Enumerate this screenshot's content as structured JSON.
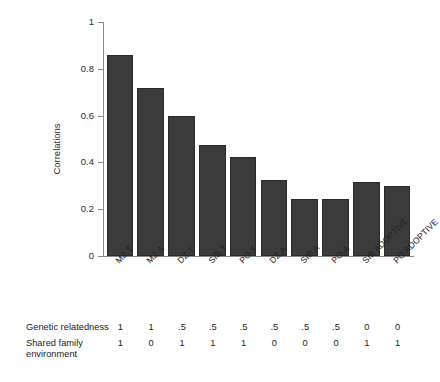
{
  "chart_data": {
    "type": "bar",
    "title": "",
    "xlabel": "",
    "ylabel": "Correlations",
    "ylim": [
      0,
      1
    ],
    "yticks": [
      "0",
      "0.2",
      "0.4",
      "0.6",
      "0.8",
      "1"
    ],
    "ytick_values": [
      0,
      0.2,
      0.4,
      0.6,
      0.8,
      1
    ],
    "grid": false,
    "legend": null,
    "bar_color": "#3b3b3b",
    "categories": [
      "MZ.T",
      "MZ.A",
      "DZ.T",
      "SIB.T",
      "PO.T",
      "DZ.A",
      "SIB.A",
      "PO.A",
      "SIB ADOPTIVE",
      "PO ADOPTIVE"
    ],
    "values": [
      0.86,
      0.72,
      0.6,
      0.475,
      0.425,
      0.325,
      0.245,
      0.245,
      0.315,
      0.3
    ],
    "annotation_rows": [
      {
        "label": "Genetic relatedness",
        "values": [
          "1",
          "1",
          ".5",
          ".5",
          ".5",
          ".5",
          ".5",
          ".5",
          "0",
          "0"
        ]
      },
      {
        "label": "Shared family environment",
        "values": [
          "1",
          "0",
          "1",
          "1",
          "1",
          "0",
          "0",
          "0",
          "1",
          "1"
        ]
      }
    ]
  },
  "axis": {
    "y_title": "Correlations",
    "y_tick_labels": [
      "1",
      "0.8",
      "0.6",
      "0.4",
      "0.2",
      "0"
    ]
  },
  "annotation": {
    "genetic_label": "Genetic relatedness",
    "shared_label_line1": "Shared family",
    "shared_label_line2": "environment"
  }
}
